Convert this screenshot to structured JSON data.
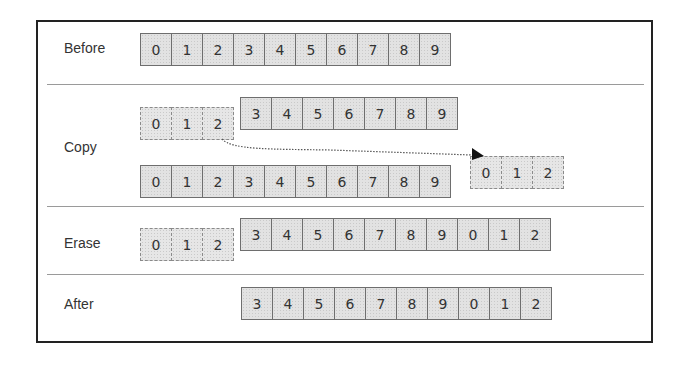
{
  "diagram": {
    "rows": [
      {
        "id": "before",
        "label": "Before",
        "strips": [
          {
            "cells": [
              "0",
              "1",
              "2",
              "3",
              "4",
              "5",
              "6",
              "7",
              "8",
              "9"
            ],
            "style": "solid"
          }
        ]
      },
      {
        "id": "copy",
        "label": "Copy",
        "strips": [
          {
            "cells": [
              "0",
              "1",
              "2"
            ],
            "style": "dashed"
          },
          {
            "cells": [
              "3",
              "4",
              "5",
              "6",
              "7",
              "8",
              "9"
            ],
            "style": "solid"
          },
          {
            "cells": [
              "0",
              "1",
              "2",
              "3",
              "4",
              "5",
              "6",
              "7",
              "8",
              "9"
            ],
            "style": "solid"
          },
          {
            "cells": [
              "0",
              "1",
              "2"
            ],
            "style": "dashed"
          }
        ],
        "arrow": {
          "from": "copy-top-cell-2",
          "to": "copy-appended-cell-0",
          "style": "dotted"
        }
      },
      {
        "id": "erase",
        "label": "Erase",
        "strips": [
          {
            "cells": [
              "0",
              "1",
              "2"
            ],
            "style": "dashed"
          },
          {
            "cells": [
              "3",
              "4",
              "5",
              "6",
              "7",
              "8",
              "9",
              "0",
              "1",
              "2"
            ],
            "style": "solid"
          }
        ]
      },
      {
        "id": "after",
        "label": "After",
        "strips": [
          {
            "cells": [
              "3",
              "4",
              "5",
              "6",
              "7",
              "8",
              "9",
              "0",
              "1",
              "2"
            ],
            "style": "solid"
          }
        ]
      }
    ]
  },
  "colors": {
    "cell_fill": "#e2e2e2",
    "cell_border": "#6e6e6e",
    "dashed_border": "#8a8a8a",
    "frame_border": "#222222",
    "separator": "#9a9a9a",
    "text": "#333333"
  }
}
